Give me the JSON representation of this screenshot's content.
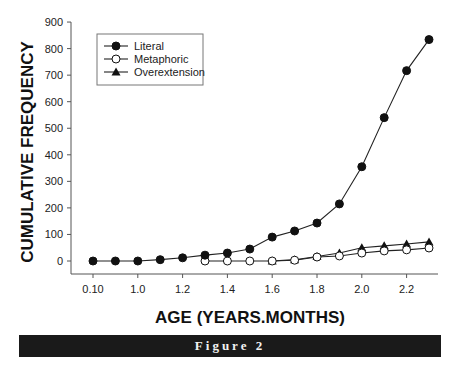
{
  "chart_data": {
    "type": "line",
    "title": "",
    "xlabel": "AGE (YEARS.MONTHS)",
    "ylabel": "CUMULATIVE FREQUENCY",
    "x": [
      "0.10",
      "0.11",
      "1.0",
      "1.1",
      "1.2",
      "1.3",
      "1.4",
      "1.5",
      "1.6",
      "1.7",
      "1.8",
      "1.9",
      "2.0",
      "2.1",
      "2.2",
      "2.3"
    ],
    "x_tick_labels": [
      "0.10",
      "1.0",
      "1.2",
      "1.4",
      "1.6",
      "1.8",
      "2.0",
      "2.2"
    ],
    "y_ticks": [
      0,
      100,
      200,
      300,
      400,
      500,
      600,
      700,
      800,
      900
    ],
    "ylim": [
      -50,
      900
    ],
    "grid": false,
    "legend_position": "upper-left",
    "series": [
      {
        "name": "Literal",
        "marker": "filled-circle",
        "values": [
          0,
          0,
          0,
          5,
          12,
          22,
          30,
          45,
          90,
          113,
          143,
          215,
          355,
          540,
          717,
          834
        ]
      },
      {
        "name": "Metaphoric",
        "marker": "open-circle",
        "values": [
          null,
          null,
          null,
          null,
          null,
          0,
          0,
          0,
          0,
          3,
          15,
          19,
          30,
          38,
          42,
          49
        ]
      },
      {
        "name": "Overextension",
        "marker": "filled-triangle",
        "values": [
          null,
          null,
          null,
          null,
          null,
          null,
          null,
          null,
          0,
          5,
          17,
          30,
          50,
          57,
          64,
          72
        ]
      }
    ]
  },
  "figure": {
    "banner_label": "Figure 2",
    "caption": "Cumulative frequency of literal, metaphoric and overextension uses"
  }
}
